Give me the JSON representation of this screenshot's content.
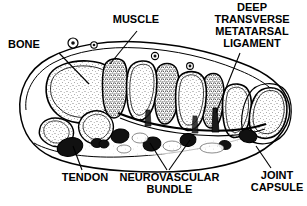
{
  "figure": {
    "background_color": "#ffffff",
    "ink_color": "#000000"
  },
  "labels": {
    "bone": "BONE",
    "muscle": "MUSCLE",
    "ligament_line1": "DEEP",
    "ligament_line2": "TRANSVERSE",
    "ligament_line3": "METATARSAL",
    "ligament_line4": "LIGAMENT",
    "tendon": "TENDON",
    "neurovascular_line1": "NEUROVASCULAR",
    "neurovascular_line2": "BUNDLE",
    "joint_line1": "JOINT",
    "joint_line2": "CAPSULE"
  },
  "structures": {
    "skin_outline": "foot-cross-section-outline",
    "bones": "metatarsal-bone-sections",
    "muscles": "interosseous-muscle-sections",
    "tendon_marks": "flexor-tendon-sections",
    "neurovascular_marks": "neurovascular-bundle-sections",
    "ligament_mark": "deep-transverse-metatarsal-ligament",
    "joint_capsule_mark": "joint-capsule-outline"
  }
}
